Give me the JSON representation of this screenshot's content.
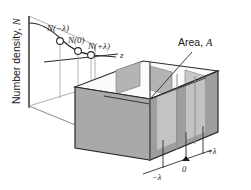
{
  "figure": {
    "type": "3d-schematic",
    "background_color": "#ffffff",
    "line_color": "#1a1a1a"
  },
  "axes": {
    "y_label": "Number density,  \u0001",
    "y_label_text": "Number density,",
    "y_label_symbol": "N",
    "z_label": "z"
  },
  "curve": {
    "name": "number-density-profile",
    "shape": "decreasing-concave",
    "markers": [
      {
        "id": "minus-lambda",
        "label_prefix": "N",
        "label_arg": "(−λ)"
      },
      {
        "id": "zero",
        "label_prefix": "N",
        "label_arg": "(0)"
      },
      {
        "id": "plus-lambda",
        "label_prefix": "N",
        "label_arg": "(+λ)"
      }
    ],
    "marker_labels": [
      "N(−λ)",
      "N(0)",
      "N(+λ)"
    ]
  },
  "annotations": {
    "area_label_text": "Area,",
    "area_label_symbol": "A",
    "area_label_full": "Area, A"
  },
  "scale": {
    "ticks": [
      {
        "id": "tick-minus-lambda",
        "label": "−λ"
      },
      {
        "id": "tick-zero",
        "label": "0"
      },
      {
        "id": "tick-plus-lambda",
        "label": "+λ"
      }
    ]
  },
  "colors": {
    "box_front_face": "#a9a9a9",
    "box_right_face": "#9e9e9e",
    "box_top_face": "#fbfbfb",
    "slab_fill": "#b4b4b4",
    "slab_fill_light": "#c9c9c9",
    "plane_fill": "#ffffff",
    "outline": "#2b2b2b",
    "thin_line": "#8a8a8a"
  }
}
